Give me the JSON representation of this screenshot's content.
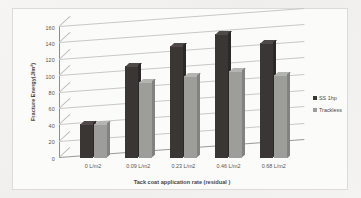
{
  "chart_data": {
    "type": "bar",
    "title": "",
    "xlabel": "Tack coat application rate (residual )",
    "ylabel": "Fracture Energy(J/m²)",
    "categories": [
      "0 L/m2",
      "0.09 L/m2",
      "0.23 L/m2",
      "0.46 L/m2",
      "0.68 L/m2"
    ],
    "series": [
      {
        "name": "SS 1hp",
        "values": [
          42,
          112,
          137,
          152,
          140
        ],
        "color": "#3a3634"
      },
      {
        "name": "Trackless",
        "values": [
          42,
          93,
          100,
          106,
          102
        ],
        "color": "#9d9d9a"
      }
    ],
    "ylim": [
      0,
      160
    ],
    "yticks": [
      0,
      20,
      40,
      60,
      80,
      100,
      120,
      140,
      160
    ],
    "ytick_labels": [
      "0",
      "20",
      "40",
      "60",
      "80",
      "100",
      "120",
      "140",
      "160"
    ],
    "grid": true,
    "legend_position": "right",
    "three_d": true
  },
  "legend": {
    "entries": [
      {
        "label": "SS 1hp",
        "swatch": "dark"
      },
      {
        "label": "Trackless",
        "swatch": "light"
      }
    ]
  }
}
